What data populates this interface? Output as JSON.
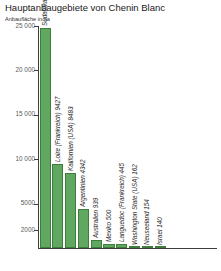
{
  "chart_data": {
    "type": "bar",
    "title": "Hauptanbaugebiete von Chenin Blanc",
    "subtitle": "Anbaufläche in ha",
    "xlabel": "",
    "ylabel": "",
    "ylim": [
      0,
      25000
    ],
    "grid": false,
    "legend": "none",
    "bar_color": "#60a860",
    "bar_border_color": "#3f7d3f",
    "y_ticks": [
      {
        "value": 25000,
        "label": "25 000"
      },
      {
        "value": 20000,
        "label": "20 000"
      },
      {
        "value": 15000,
        "label": "15 000"
      },
      {
        "value": 10000,
        "label": "10 000"
      },
      {
        "value": 5000,
        "label": "5000"
      },
      {
        "value": 2000,
        "label": "2000"
      }
    ],
    "categories": [
      "Südafrika",
      "Loire (Frankreich)",
      "Kalifornien (USA)",
      "Argentinien",
      "Australien",
      "Mexiko",
      "Languedoc (Frankreich)",
      "Washington State (USA)",
      "Neuseeland",
      "Israel"
    ],
    "values": [
      24795,
      9427,
      8483,
      4342,
      939,
      500,
      445,
      162,
      154,
      140
    ],
    "bar_labels": [
      "Südafrika 24 795",
      "Loire (Frankreich) 9427",
      "Kalifornien (USA) 8483",
      "Argentinien 4342",
      "Australien 939",
      "Mexiko 500",
      "Languedoc (Frankreich) 445",
      "Washington State (USA) 162",
      "Neuseeland 154",
      "Israel 140"
    ]
  }
}
